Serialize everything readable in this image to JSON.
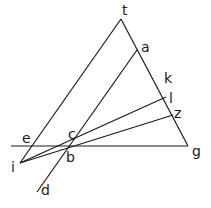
{
  "diagram": {
    "type": "geometric-construction",
    "stroke_color": "#1a1a1a",
    "background": "#ffffff",
    "points": {
      "t": {
        "x": 121,
        "y": 19,
        "label": "t",
        "lx": 122,
        "ly": 15
      },
      "a": {
        "x": 137,
        "y": 50,
        "label": "a",
        "lx": 141,
        "ly": 52
      },
      "k": {
        "x": 160,
        "y": 83,
        "label": "k",
        "lx": 164,
        "ly": 83
      },
      "l": {
        "x": 166,
        "y": 97,
        "label": "l",
        "lx": 169,
        "ly": 103
      },
      "z": {
        "x": 173,
        "y": 115,
        "label": "z",
        "lx": 174,
        "ly": 118
      },
      "g": {
        "x": 188,
        "y": 146,
        "label": "g",
        "lx": 192,
        "ly": 156
      },
      "e": {
        "x": 30,
        "y": 146,
        "label": "e",
        "lx": 22,
        "ly": 143
      },
      "c": {
        "x": 74,
        "y": 137,
        "label": "c",
        "lx": 68,
        "ly": 139
      },
      "b": {
        "x": 67,
        "y": 148,
        "label": "b",
        "lx": 66,
        "ly": 162
      },
      "i": {
        "x": 20,
        "y": 163,
        "label": "i",
        "lx": 11,
        "ly": 172
      },
      "d": {
        "x": 37,
        "y": 192,
        "label": "d",
        "lx": 41,
        "ly": 195
      }
    },
    "segments": [
      {
        "name": "t-g",
        "from": "t",
        "to": "g"
      },
      {
        "name": "t-i",
        "from": "t",
        "to": "i"
      },
      {
        "name": "a-d",
        "from": "a",
        "to": "d"
      },
      {
        "name": "baseline",
        "x1": 11,
        "y1": 146,
        "x2": 188,
        "y2": 146
      },
      {
        "name": "i-l",
        "from": "i",
        "to": "l"
      },
      {
        "name": "i-z",
        "from": "i",
        "to": "z"
      }
    ]
  }
}
